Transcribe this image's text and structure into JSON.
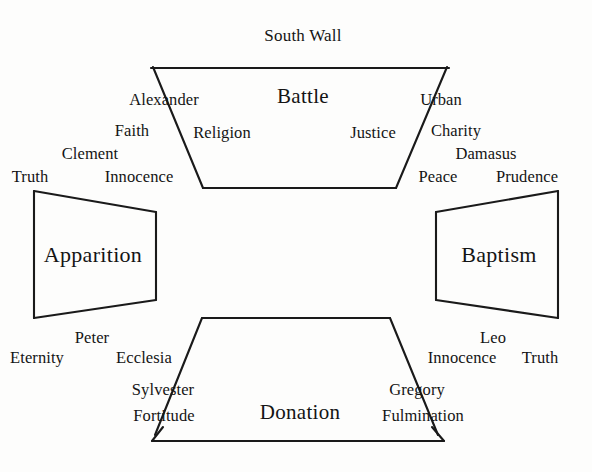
{
  "diagram": {
    "title": "South Wall",
    "scenes": [
      {
        "id": "battle",
        "label": "Battle",
        "x": 303,
        "y": 96,
        "size": "top"
      },
      {
        "id": "apparition",
        "label": "Apparition",
        "x": 93,
        "y": 255,
        "size": "side"
      },
      {
        "id": "baptism",
        "label": "Baptism",
        "x": 499,
        "y": 255,
        "size": "side"
      },
      {
        "id": "donation",
        "label": "Donation",
        "x": 300,
        "y": 412,
        "size": "bottom"
      }
    ],
    "labels": [
      {
        "id": "alexander",
        "text": "Alexander",
        "x": 164,
        "y": 100
      },
      {
        "id": "urban",
        "text": "Urban",
        "x": 441,
        "y": 100
      },
      {
        "id": "faith",
        "text": "Faith",
        "x": 132,
        "y": 131
      },
      {
        "id": "religion",
        "text": "Religion",
        "x": 222,
        "y": 133
      },
      {
        "id": "justice",
        "text": "Justice",
        "x": 373,
        "y": 133
      },
      {
        "id": "charity",
        "text": "Charity",
        "x": 456,
        "y": 131
      },
      {
        "id": "clement",
        "text": "Clement",
        "x": 90,
        "y": 154
      },
      {
        "id": "damasus",
        "text": "Damasus",
        "x": 486,
        "y": 154
      },
      {
        "id": "truth-top",
        "text": "Truth",
        "x": 30,
        "y": 177
      },
      {
        "id": "innocence-top",
        "text": "Innocence",
        "x": 139,
        "y": 177
      },
      {
        "id": "peace",
        "text": "Peace",
        "x": 438,
        "y": 177
      },
      {
        "id": "prudence",
        "text": "Prudence",
        "x": 527,
        "y": 177
      },
      {
        "id": "peter",
        "text": "Peter",
        "x": 92,
        "y": 338
      },
      {
        "id": "leo",
        "text": "Leo",
        "x": 493,
        "y": 338
      },
      {
        "id": "eternity",
        "text": "Eternity",
        "x": 37,
        "y": 358
      },
      {
        "id": "ecclesia",
        "text": "Ecclesia",
        "x": 144,
        "y": 358
      },
      {
        "id": "innocence-bottom",
        "text": "Innocence",
        "x": 462,
        "y": 358
      },
      {
        "id": "truth-bottom",
        "text": "Truth",
        "x": 540,
        "y": 358
      },
      {
        "id": "sylvester",
        "text": "Sylvester",
        "x": 163,
        "y": 390
      },
      {
        "id": "gregory",
        "text": "Gregory",
        "x": 417,
        "y": 390
      },
      {
        "id": "fortitude",
        "text": "Fortitude",
        "x": 164,
        "y": 416
      },
      {
        "id": "fulmination",
        "text": "Fulmination",
        "x": 423,
        "y": 416
      }
    ],
    "colors": {
      "stroke": "#1a1a1a",
      "background": "#fdfdfc",
      "text": "#141414"
    },
    "shapes": {
      "top_panel": "M153,67 L203,188 L396,188 L449,67",
      "top_panel_cap": "M153,67 L451,67",
      "left_panel": "M33,191 L155,212 L155,299 L33,318 Z",
      "right_panel": "M558,191 L436,212 L436,299 L558,318 Z",
      "bottom_panel": "M202,318 L390,318 L440,440 L152,440",
      "bottom_panel_cap": "M152,440 L445,440"
    }
  }
}
